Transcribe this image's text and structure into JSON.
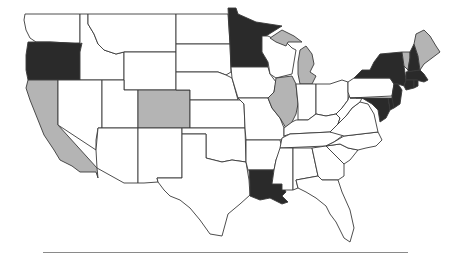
{
  "map": {
    "type": "choropleth",
    "region": "United States (contiguous)",
    "legend_visible": false,
    "categories": {
      "dark": {
        "color": "#2a2a2a",
        "states": [
          "Oregon",
          "Minnesota",
          "Louisiana",
          "New York",
          "New Hampshire",
          "Massachusetts",
          "Connecticut",
          "Rhode Island",
          "New Jersey",
          "Delaware",
          "Maryland"
        ]
      },
      "gray": {
        "color": "#b4b4b4",
        "states": [
          "California",
          "Colorado",
          "Illinois",
          "Michigan",
          "Vermont",
          "Maine"
        ]
      },
      "none": {
        "color": "#ffffff",
        "states": [
          "Washington",
          "Idaho",
          "Montana",
          "Wyoming",
          "Nevada",
          "Utah",
          "Arizona",
          "New Mexico",
          "North Dakota",
          "South Dakota",
          "Nebraska",
          "Kansas",
          "Oklahoma",
          "Texas",
          "Iowa",
          "Missouri",
          "Arkansas",
          "Wisconsin",
          "Indiana",
          "Ohio",
          "Kentucky",
          "Tennessee",
          "Mississippi",
          "Alabama",
          "Georgia",
          "Florida",
          "South Carolina",
          "North Carolina",
          "Virginia",
          "West Virginia",
          "Pennsylvania"
        ]
      }
    }
  },
  "states": [
    {
      "name": "Washington",
      "fill": "#ffffff",
      "points": "25,14 40,14 80,14 80,44 70,43 50,42 36,42 30,38 26,30 24,20"
    },
    {
      "name": "Oregon",
      "fill": "#2a2a2a",
      "points": "28,42 36,42 50,42 70,43 82,43 80,52 80,80 58,80 28,80 26,70 26,55"
    },
    {
      "name": "California",
      "fill": "#b4b4b4",
      "points": "28,80 58,80 58,125 97,168 98,178 96,172 80,172 72,166 60,160 54,150 44,135 36,115 30,100 26,88"
    },
    {
      "name": "Idaho",
      "fill": "#ffffff",
      "points": "80,14 88,14 88,24 94,34 98,44 104,50 116,54 124,52 124,80 102,80 80,80 80,52 82,43 80,44"
    },
    {
      "name": "Nevada",
      "fill": "#ffffff",
      "points": "58,80 102,80 102,128 98,128 96,140 96,150 58,125"
    },
    {
      "name": "Montana",
      "fill": "#ffffff",
      "points": "88,14 176,14 176,52 124,52 116,54 104,50 98,44 94,34 88,24"
    },
    {
      "name": "Wyoming",
      "fill": "#ffffff",
      "points": "124,52 176,52 176,90 124,90"
    },
    {
      "name": "Utah",
      "fill": "#ffffff",
      "points": "102,80 124,80 124,90 138,90 138,128 102,128"
    },
    {
      "name": "Colorado",
      "fill": "#b4b4b4",
      "points": "138,90 190,90 190,128 138,128"
    },
    {
      "name": "Arizona",
      "fill": "#ffffff",
      "points": "102,128 138,128 138,183 124,183 97,168 96,150 98,128"
    },
    {
      "name": "New Mexico",
      "fill": "#ffffff",
      "points": "138,128 182,128 182,178 157,178 158,182 144,183 138,183"
    },
    {
      "name": "North Dakota",
      "fill": "#ffffff",
      "points": "176,14 228,14 230,44 176,44"
    },
    {
      "name": "South Dakota",
      "fill": "#ffffff",
      "points": "176,44 230,44 231,72 226,75 218,72 176,72"
    },
    {
      "name": "Nebraska",
      "fill": "#ffffff",
      "points": "176,72 218,72 226,75 232,78 238,100 190,100 190,90 176,90"
    },
    {
      "name": "Kansas",
      "fill": "#ffffff",
      "points": "190,100 240,100 244,104 245,128 190,128"
    },
    {
      "name": "Oklahoma",
      "fill": "#ffffff",
      "points": "182,128 245,128 246,162 232,160 222,162 206,158 206,134 182,134"
    },
    {
      "name": "Texas",
      "fill": "#ffffff",
      "points": "182,134 206,134 206,158 222,162 232,160 246,162 249,180 250,195 240,204 228,214 222,236 210,234 200,220 190,208 180,200 170,196 164,190 158,182 157,178 182,178"
    },
    {
      "name": "Minnesota",
      "fill": "#2a2a2a",
      "points": "228,8 236,8 238,14 256,22 282,26 266,36 262,42 262,52 268,62 268,67 231,67 230,44"
    },
    {
      "name": "Iowa",
      "fill": "#ffffff",
      "points": "231,67 268,67 270,74 276,82 274,92 268,98 238,98 232,78"
    },
    {
      "name": "Missouri",
      "fill": "#ffffff",
      "points": "238,98 268,98 272,108 280,118 284,128 284,138 280,140 246,140 245,128 244,104 240,100"
    },
    {
      "name": "Arkansas",
      "fill": "#ffffff",
      "points": "246,140 280,140 282,148 276,160 274,170 248,170 246,162"
    },
    {
      "name": "Louisiana",
      "fill": "#2a2a2a",
      "points": "249,170 274,170 272,184 282,184 286,192 282,196 288,202 282,204 270,198 260,200 250,196 250,185"
    },
    {
      "name": "Wisconsin",
      "fill": "#ffffff",
      "points": "262,36 268,36 276,40 286,42 292,48 296,50 294,62 292,74 276,78 270,74 268,62 262,52"
    },
    {
      "name": "Illinois",
      "fill": "#b4b4b4",
      "points": "276,78 292,76 296,84 298,104 296,114 292,122 286,128 280,118 272,108 268,98 274,92"
    },
    {
      "name": "Michigan",
      "fill": "#b4b4b4",
      "points": "270,38 282,30 294,36 302,42 288,42 286,46 276,42 ; 300,50 306,46 312,54 314,64 310,72 316,76 312,84 300,84 298,74 298,62"
    },
    {
      "name": "Indiana",
      "fill": "#ffffff",
      "points": "296,84 316,84 316,114 308,120 298,120 298,104"
    },
    {
      "name": "Ohio",
      "fill": "#ffffff",
      "points": "316,84 330,84 342,80 348,82 348,100 342,108 336,114 326,116 316,114"
    },
    {
      "name": "Kentucky",
      "fill": "#ffffff",
      "points": "284,128 292,122 296,120 308,120 316,114 326,116 336,114 340,118 338,124 330,132 290,134 284,136"
    },
    {
      "name": "Tennessee",
      "fill": "#ffffff",
      "points": "282,138 290,134 330,132 344,130 342,136 334,142 326,146 280,148"
    },
    {
      "name": "Mississippi",
      "fill": "#ffffff",
      "points": "280,148 293,148 293,190 282,190 282,184 272,184 274,170 276,160"
    },
    {
      "name": "Alabama",
      "fill": "#ffffff",
      "points": "293,148 312,148 318,176 296,180 298,188 293,190"
    },
    {
      "name": "Georgia",
      "fill": "#ffffff",
      "points": "312,148 326,146 334,154 344,164 344,176 338,180 322,180 318,176"
    },
    {
      "name": "Florida",
      "fill": "#ffffff",
      "points": "296,180 318,176 322,180 338,180 342,192 350,210 354,228 350,242 344,238 336,222 330,214 326,206 316,198 306,192 298,188"
    },
    {
      "name": "South Carolina",
      "fill": "#ffffff",
      "points": "326,146 340,144 348,148 358,150 350,160 344,164 334,154"
    },
    {
      "name": "North Carolina",
      "fill": "#ffffff",
      "points": "334,142 344,136 378,132 382,140 376,146 366,148 358,150 348,148 340,144 326,146"
    },
    {
      "name": "Virginia",
      "fill": "#ffffff",
      "points": "330,132 338,124 346,116 352,108 360,102 368,104 374,114 378,132 344,136"
    },
    {
      "name": "West Virginia",
      "fill": "#ffffff",
      "points": "336,114 342,108 348,100 350,92 356,98 362,98 360,102 352,108 346,116 338,124 340,118"
    },
    {
      "name": "Pennsylvania",
      "fill": "#ffffff",
      "points": "348,82 354,78 390,78 394,84 392,96 350,98 348,92"
    },
    {
      "name": "New York",
      "fill": "#2a2a2a",
      "points": "354,78 362,70 370,70 374,62 380,54 402,52 404,66 406,80 404,86 398,84 394,84 390,78"
    },
    {
      "name": "Vermont",
      "fill": "#b4b4b4",
      "points": "402,52 410,52 410,58 408,70 404,66"
    },
    {
      "name": "New Hampshire",
      "fill": "#2a2a2a",
      "points": "410,52 414,44 418,56 420,70 408,72 408,70 410,58"
    },
    {
      "name": "Maine",
      "fill": "#b4b4b4",
      "points": "414,44 416,34 424,30 430,36 436,46 440,52 432,58 424,64 420,70 418,56"
    },
    {
      "name": "Massachusetts",
      "fill": "#2a2a2a",
      "points": "406,72 420,70 424,74 428,80 424,82 416,80 406,80"
    },
    {
      "name": "Connecticut",
      "fill": "#2a2a2a",
      "points": "406,80 414,80 414,88 406,90 404,86"
    },
    {
      "name": "Rhode Island",
      "fill": "#2a2a2a",
      "points": "414,80 418,80 418,86 414,88"
    },
    {
      "name": "New Jersey",
      "fill": "#2a2a2a",
      "points": "394,84 398,84 402,90 400,104 394,108 392,102 392,96"
    },
    {
      "name": "Delaware",
      "fill": "#2a2a2a",
      "points": "388,98 392,98 394,108 390,110"
    },
    {
      "name": "Maryland",
      "fill": "#2a2a2a",
      "points": "350,98 388,98 390,110 386,118 380,122 378,110 372,104 362,98"
    }
  ]
}
